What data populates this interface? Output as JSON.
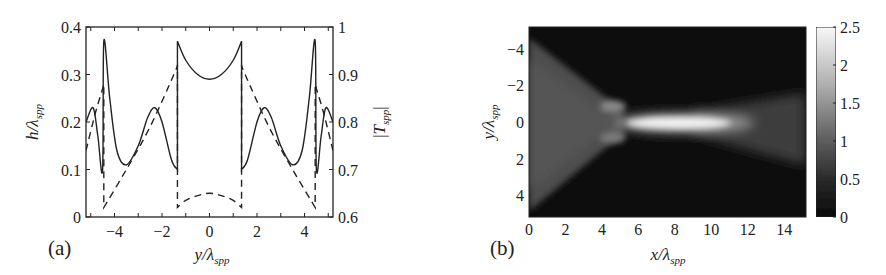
{
  "figure": {
    "panels": [
      {
        "label": "(a)",
        "xlabel": "y/λspp",
        "ylabel_left": "h/λspp",
        "ylabel_right": "|Tspp|"
      },
      {
        "label": "(b)",
        "xlabel": "x/λspp",
        "ylabel": "y/λspp",
        "colorbar_label": ""
      }
    ]
  },
  "chart_data": [
    {
      "type": "line",
      "panel": "(a)",
      "title": "",
      "xlabel": "y/λspp",
      "ylabel": "h/λspp",
      "ylabel_right": "|Tspp|",
      "xlim": [
        -5.2,
        5.2
      ],
      "ylim": [
        0,
        0.4
      ],
      "ylim_right": [
        0.6,
        1.0
      ],
      "xticks": [
        "-4",
        "-2",
        "0",
        "2",
        "4"
      ],
      "yticks": [
        "0",
        "0.1",
        "0.2",
        "0.3",
        "0.4"
      ],
      "yticks_right": [
        "0.6",
        "0.7",
        "0.8",
        "0.9",
        "1"
      ],
      "grid": false,
      "legend": null,
      "series": [
        {
          "name": "h/λspp (solid)",
          "style": "solid",
          "axis": "left",
          "x": [
            -5.2,
            -4.9,
            -4.7,
            -4.5,
            -4.45,
            -4.2,
            -3.9,
            -3.5,
            -3.0,
            -2.6,
            -2.3,
            -2.0,
            -1.6,
            -1.35,
            -1.35,
            -1.0,
            -0.5,
            0.0,
            0.5,
            1.0,
            1.35,
            1.35,
            1.6,
            2.0,
            2.3,
            2.6,
            3.0,
            3.5,
            3.9,
            4.2,
            4.45,
            4.5,
            4.7,
            4.9,
            5.2
          ],
          "y": [
            0.2,
            0.23,
            0.17,
            0.1,
            0.37,
            0.25,
            0.14,
            0.11,
            0.15,
            0.21,
            0.23,
            0.2,
            0.12,
            0.1,
            0.37,
            0.33,
            0.3,
            0.29,
            0.3,
            0.33,
            0.37,
            0.1,
            0.12,
            0.2,
            0.23,
            0.21,
            0.15,
            0.11,
            0.14,
            0.25,
            0.37,
            0.1,
            0.17,
            0.23,
            0.2
          ]
        },
        {
          "name": "|Tspp| (dashed)",
          "style": "dashed",
          "axis": "right",
          "x": [
            -5.2,
            -4.8,
            -4.5,
            -4.45,
            -4.45,
            -3.5,
            -2.5,
            -1.5,
            -1.35,
            -1.35,
            -1.0,
            -0.5,
            0.0,
            0.5,
            1.0,
            1.35,
            1.35,
            1.5,
            2.5,
            3.5,
            4.45,
            4.45,
            4.5,
            4.8,
            5.2
          ],
          "y": [
            0.74,
            0.82,
            0.87,
            0.88,
            0.62,
            0.7,
            0.79,
            0.9,
            0.92,
            0.62,
            0.635,
            0.645,
            0.65,
            0.645,
            0.635,
            0.62,
            0.92,
            0.9,
            0.79,
            0.7,
            0.62,
            0.88,
            0.87,
            0.82,
            0.74
          ]
        }
      ]
    },
    {
      "type": "heatmap",
      "panel": "(b)",
      "title": "",
      "xlabel": "x/λspp",
      "ylabel": "y/λspp",
      "xlim": [
        0,
        15.2
      ],
      "ylim": [
        -5.2,
        5.2
      ],
      "y_reversed": true,
      "xticks": [
        "0",
        "2",
        "4",
        "6",
        "8",
        "10",
        "12",
        "14"
      ],
      "yticks": [
        "-4",
        "-2",
        "0",
        "2",
        "4"
      ],
      "colormap": "gray",
      "colorbar": {
        "min": 0,
        "max": 2.5,
        "ticks": [
          "0",
          "0.5",
          "1",
          "1.5",
          "2",
          "2.5"
        ]
      },
      "features": [
        {
          "desc": "diverging triangular gray region from left edge converging at x≈5",
          "x_range": [
            0,
            5.5
          ],
          "value": 0.7
        },
        {
          "desc": "bright focal spot along y=0",
          "x_range": [
            5.5,
            12
          ],
          "y_center": 0,
          "half_width": 0.4,
          "peak": 2.5
        },
        {
          "desc": "two side lobes near x≈4.5",
          "x": 4.5,
          "y": [
            -0.8,
            0.8
          ],
          "value": 1.2
        },
        {
          "desc": "expanding gray beam after focus",
          "x_range": [
            11,
            15.2
          ],
          "value": 0.6
        }
      ]
    }
  ]
}
